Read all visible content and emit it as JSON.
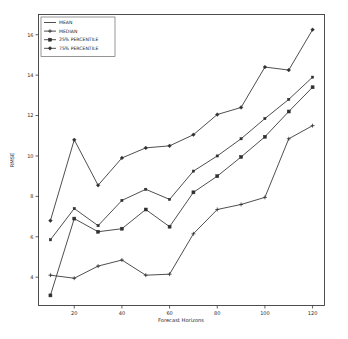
{
  "chart_data": {
    "type": "line",
    "title": "",
    "xlabel": "Forecast Horizons",
    "ylabel": "RMSE",
    "x": [
      10,
      20,
      30,
      40,
      50,
      60,
      70,
      80,
      90,
      100,
      110,
      120
    ],
    "xlim": [
      5,
      125
    ],
    "ylim": [
      2.6,
      17.0
    ],
    "xticks": [
      20,
      40,
      60,
      80,
      100,
      120
    ],
    "yticks": [
      4,
      6,
      8,
      10,
      12,
      14,
      16
    ],
    "grid": false,
    "legend_position": "upper-left",
    "series": [
      {
        "name": "MEAN",
        "values": [
          5.85,
          7.4,
          6.55,
          7.8,
          8.35,
          7.85,
          9.25,
          10.0,
          10.85,
          11.85,
          12.8,
          13.9
        ]
      },
      {
        "name": "MEDIAN",
        "values": [
          4.1,
          3.95,
          4.55,
          4.85,
          4.1,
          4.15,
          6.15,
          7.35,
          7.6,
          7.95,
          10.85,
          11.5
        ]
      },
      {
        "name": "25% PERCENTILE",
        "values": [
          3.1,
          6.9,
          6.25,
          6.4,
          7.35,
          6.5,
          8.2,
          9.0,
          9.95,
          10.95,
          12.2,
          13.4
        ]
      },
      {
        "name": "75% PERCENTILE",
        "values": [
          6.8,
          10.8,
          8.55,
          9.9,
          10.4,
          10.5,
          11.05,
          12.05,
          12.4,
          14.4,
          14.25,
          16.25
        ]
      }
    ]
  },
  "legend": {
    "entries": [
      {
        "label": "MEAN",
        "marker": "none"
      },
      {
        "label": "MEDIAN",
        "marker": "plus"
      },
      {
        "label": "25% PERCENTILE",
        "marker": "square"
      },
      {
        "label": "75% PERCENTILE",
        "marker": "diamond"
      }
    ]
  },
  "axes": {
    "x_tick_labels": [
      "20",
      "40",
      "60",
      "80",
      "100",
      "120"
    ],
    "y_tick_labels": [
      "4",
      "6",
      "8",
      "10",
      "12",
      "14",
      "16"
    ],
    "x_axis_title": "Forecast Horizons",
    "y_axis_title": "RMSE"
  },
  "colors": {
    "line": "#2f2f2f",
    "axis": "#3b3b3b",
    "background": "#ffffff",
    "text": "#2b2b2b"
  }
}
